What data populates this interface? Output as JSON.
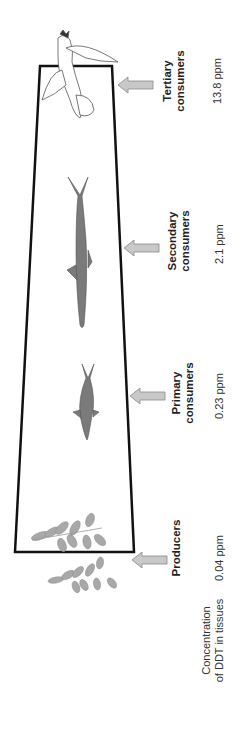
{
  "diagram": {
    "levels": [
      {
        "id": "producers",
        "line1": "Producers",
        "line2": "",
        "concentration": "0.04 ppm",
        "organism": "algae/plant leaves"
      },
      {
        "id": "primary",
        "line1": "Primary",
        "line2": "consumers",
        "concentration": "0.23 ppm",
        "organism": "small fish"
      },
      {
        "id": "secondary",
        "line1": "Secondary",
        "line2": "consumers",
        "concentration": "2.1 ppm",
        "organism": "large fish"
      },
      {
        "id": "tertiary",
        "line1": "Tertiary",
        "line2": "consumers",
        "concentration": "13.8 ppm",
        "organism": "bird (osprey)"
      }
    ],
    "row_label": {
      "line1": "Concentration",
      "line2": "of DDT in tissues"
    },
    "colors": {
      "outline": "#111111",
      "arrow_fill": "#c8c8c8",
      "arrow_stroke": "#888888",
      "fish": "#7a7a7a",
      "leaf": "#a0a0a0"
    }
  }
}
